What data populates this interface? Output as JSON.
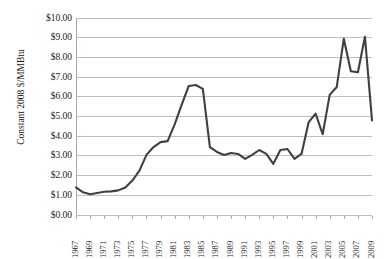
{
  "chart_data": {
    "type": "line",
    "title": "",
    "xlabel": "",
    "ylabel": "Constant 2008 $/MMBtu",
    "ylim": [
      0,
      10
    ],
    "ytick_labels": [
      "$10.00",
      "$9.00",
      "$8.00",
      "$7.00",
      "$6.00",
      "$5.00",
      "$4.00",
      "$3.00",
      "$2.00",
      "$1.00",
      "$0.00"
    ],
    "ytick_values": [
      10,
      9,
      8,
      7,
      6,
      5,
      4,
      3,
      2,
      1,
      0
    ],
    "xtick_labels": [
      "1967",
      "1969",
      "1971",
      "1973",
      "1975",
      "1977",
      "1979",
      "1981",
      "1983",
      "1985",
      "1987",
      "1989",
      "1991",
      "1993",
      "1995",
      "1997",
      "1999",
      "2001",
      "2003",
      "2005",
      "2007",
      "2009"
    ],
    "grid": true,
    "legend": "none",
    "line_color": "#404040",
    "x": [
      1967,
      1968,
      1969,
      1970,
      1971,
      1972,
      1973,
      1974,
      1975,
      1976,
      1977,
      1978,
      1979,
      1980,
      1981,
      1982,
      1983,
      1984,
      1985,
      1986,
      1987,
      1988,
      1989,
      1990,
      1991,
      1992,
      1993,
      1994,
      1995,
      1996,
      1997,
      1998,
      1999,
      2000,
      2001,
      2002,
      2003,
      2004,
      2005,
      2006,
      2007,
      2008,
      2009
    ],
    "series": [
      {
        "name": "Constant 2008 $/MMBtu",
        "values": [
          1.4,
          1.15,
          1.05,
          1.12,
          1.18,
          1.2,
          1.25,
          1.4,
          1.75,
          2.25,
          3.05,
          3.45,
          3.7,
          3.75,
          4.6,
          5.6,
          6.55,
          6.6,
          6.4,
          3.45,
          3.2,
          3.05,
          3.15,
          3.1,
          2.85,
          3.05,
          3.3,
          3.1,
          2.6,
          3.3,
          3.35,
          2.85,
          3.1,
          4.7,
          5.15,
          4.1,
          6.1,
          6.5,
          8.95,
          7.3,
          7.25,
          9.05,
          4.8
        ]
      }
    ]
  }
}
